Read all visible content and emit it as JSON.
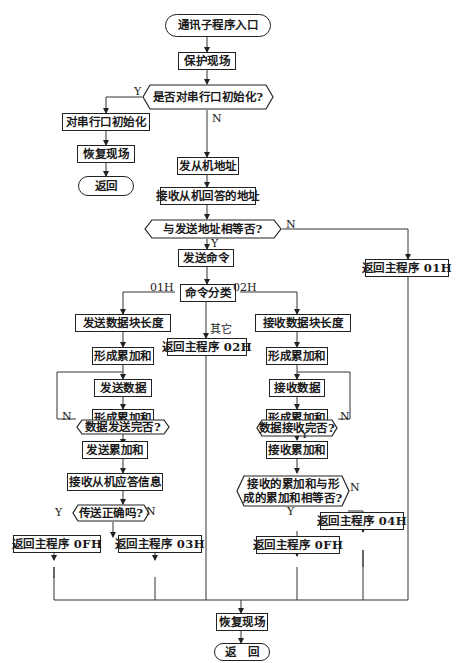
{
  "diagram": {
    "nodes": {
      "start": "通讯子程序入口",
      "save_context": "保护现场",
      "init_serial_q": "是否对串行口初始化?",
      "init_serial": "对串行口初始化",
      "restore_left": "恢复现场",
      "return_left": "返回",
      "send_slave_addr": "发从机地址",
      "recv_slave_addr": "接收从机回答的地址",
      "addr_equal_q": "与发送地址相等否?",
      "return_01h": "返回主程序 01H",
      "send_cmd": "发送命令",
      "cmd_classify": "命令分类",
      "return_02h": "返回主程序 02H",
      "send_block_len": "发送数据块长度",
      "send_form_sum1": "形成累加和",
      "send_data": "发送数据",
      "send_form_sum2": "形成累加和",
      "send_done_q": "数据发送完否?",
      "send_sum": "发送累加和",
      "recv_slave_reply": "接收从机应答信息",
      "send_ok_q": "传送正确吗?",
      "return_0fh_left": "返回主程序 0FH",
      "return_03h": "返回主程序 03H",
      "recv_block_len": "接收数据块长度",
      "recv_form_sum1": "形成累加和",
      "recv_data": "接收数据",
      "recv_form_sum2": "形成累加和",
      "recv_done_q": "数据接收完否?",
      "recv_sum": "接收累加和",
      "sum_equal_q_line1": "接收的累加和与形",
      "sum_equal_q_line2": "成的累加和相等否?",
      "return_04h": "返回主程序 04H",
      "return_0fh_right": "返回主程序 0FH",
      "restore_final": "恢复现场",
      "return_final": "返　回"
    },
    "edge_labels": {
      "init_yes": "Y",
      "init_no": "N",
      "addr_no": "N",
      "addr_yes": "Y",
      "cmd_01h": "01H",
      "cmd_02h": "02H",
      "cmd_other": "其它",
      "send_done_no": "N",
      "send_ok_yes": "Y",
      "send_ok_no": "N",
      "recv_done_no": "N",
      "recv_done_yes": "Y",
      "sum_equal_no": "N",
      "sum_equal_yes": "Y"
    }
  }
}
